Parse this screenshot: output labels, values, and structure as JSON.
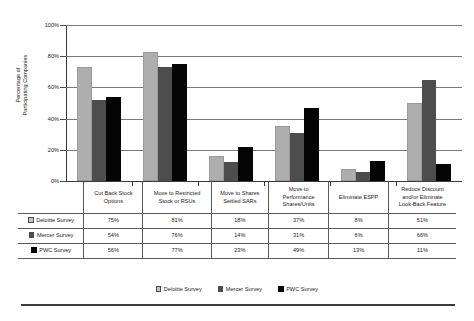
{
  "chart_data": {
    "type": "bar",
    "title": "",
    "xlabel": "",
    "ylabel": "Percentage of Participating Companies",
    "ylabel_line1": "Percentage of",
    "ylabel_line2": "Participating Companies",
    "ylim": [
      0,
      100
    ],
    "ytick_labels": [
      "100%",
      "80%",
      "60%",
      "40%",
      "20%",
      "0%"
    ],
    "ytick_values": [
      100,
      80,
      60,
      40,
      20,
      0
    ],
    "grid": true,
    "legend_position": "bottom",
    "categories": [
      "Cut Back Stock Options",
      "Move to Restricted Stock or RSUs",
      "Move to Shares Settled SARs",
      "Move to Performance Shares/Units",
      "Eliminate ESPP",
      "Reduce Discount and/or Eliminate Look-Back Feature"
    ],
    "category_label_lines": [
      [
        "Cut Back Stock",
        "Options"
      ],
      [
        "Move to Restricted",
        "Stock or RSUs"
      ],
      [
        "Move to Shares",
        "Settled SARs"
      ],
      [
        "Move to",
        "Performance",
        "Shares/Units"
      ],
      [
        "Eliminate ESPP"
      ],
      [
        "Reduce Discount",
        "and/or Eliminate",
        "Look-Back Feature"
      ]
    ],
    "series": [
      {
        "name": "Deloitte Survey",
        "color": "#aeaeae",
        "values": [
          75,
          81,
          18,
          37,
          8,
          51
        ],
        "value_labels": [
          "75%",
          "81%",
          "18%",
          "37%",
          "8%",
          "51%"
        ],
        "plotted_values": [
          73,
          83,
          16,
          35,
          8,
          50
        ]
      },
      {
        "name": "Mercer Survey",
        "color": "#4d4d4d",
        "values": [
          54,
          76,
          14,
          31,
          6,
          66
        ],
        "value_labels": [
          "54%",
          "76%",
          "14%",
          "31%",
          "6%",
          "66%"
        ],
        "plotted_values": [
          52,
          73,
          12,
          31,
          6,
          65
        ]
      },
      {
        "name": "PWC Survey",
        "color": "#050505",
        "values": [
          56,
          77,
          23,
          49,
          13,
          11
        ],
        "value_labels": [
          "56%",
          "77%",
          "23%",
          "49%",
          "13%",
          "11%"
        ],
        "plotted_values": [
          54,
          75,
          22,
          47,
          13,
          11
        ]
      }
    ]
  },
  "table": {
    "header_blank": "",
    "headers": [
      "Cut Back Stock Options",
      "Move to Restricted Stock or RSUs",
      "Move to Shares Settled SARs",
      "Move to Performance Shares/Units",
      "Eliminate ESPP",
      "Reduce Discount and/or Eliminate Look-Back Feature"
    ],
    "rows": [
      {
        "label": "Deloitte Survey",
        "swatch": "legend-swatch-deloitte",
        "values": [
          "75%",
          "81%",
          "18%",
          "37%",
          "8%",
          "51%"
        ]
      },
      {
        "label": "Mercer Survey",
        "swatch": "legend-swatch-mercer",
        "values": [
          "54%",
          "76%",
          "14%",
          "31%",
          "6%",
          "66%"
        ]
      },
      {
        "label": "PWC Survey",
        "swatch": "legend-swatch-pwc",
        "values": [
          "56%",
          "77%",
          "23%",
          "49%",
          "13%",
          "11%"
        ]
      }
    ]
  },
  "legend": {
    "items": [
      {
        "label": "Deloitte Survey",
        "color": "#c6c6c6"
      },
      {
        "label": "Mercer Survey",
        "color": "#4d4d4d"
      },
      {
        "label": "PWC Survey",
        "color": "#050505"
      }
    ]
  }
}
